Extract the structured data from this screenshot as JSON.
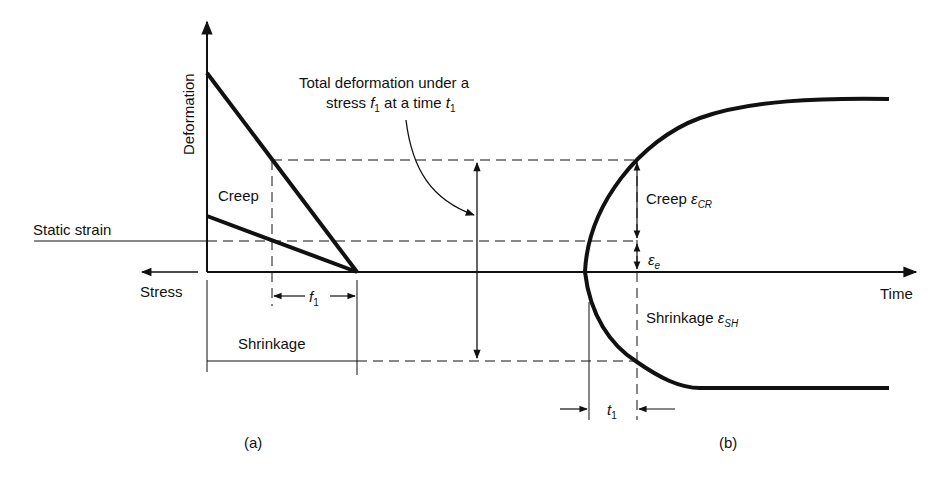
{
  "figure": {
    "panel_a": {
      "caption": "(a)",
      "y_axis_label": "Deformation",
      "x_axis_label": "Stress",
      "creep_label": "Creep",
      "static_strain_label": "Static strain",
      "shrinkage_label": "Shrinkage",
      "stress_marker": {
        "symbol": "f",
        "subscript": "1"
      }
    },
    "annotation": {
      "line1": "Total deformation under a",
      "line2_prefix": "stress ",
      "line2_f": "f",
      "line2_f_sub": "1",
      "line2_mid": " at a time ",
      "line2_t": "t",
      "line2_t_sub": "1"
    },
    "panel_b": {
      "caption": "(b)",
      "x_axis_label": "Time",
      "creep_label": "Creep",
      "creep_symbol": "ε",
      "creep_sub": "CR",
      "elastic_symbol": "ε",
      "elastic_sub": "e",
      "shrinkage_label": "Shrinkage",
      "shrinkage_symbol": "ε",
      "shrinkage_sub": "SH",
      "time_marker": {
        "symbol": "t",
        "subscript": "1"
      }
    },
    "colors": {
      "line": "#111111",
      "background": "#ffffff"
    }
  }
}
